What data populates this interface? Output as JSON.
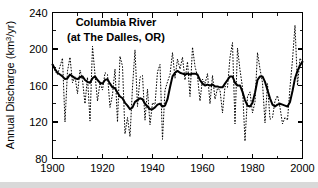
{
  "chart_data": {
    "type": "line",
    "title": "Columbia River",
    "subtitle": "(at The Dalles, OR)",
    "xlabel": "",
    "ylabel": "Annual Discharge (km3/yr)",
    "ylabel_main": "Annual Discharge (km",
    "ylabel_sup": "3",
    "ylabel_tail": "/yr)",
    "xlim": [
      1900,
      2000
    ],
    "ylim": [
      80,
      240
    ],
    "x_ticks": [
      1900,
      1920,
      1940,
      1960,
      1980,
      2000
    ],
    "y_ticks": [
      80,
      120,
      160,
      200,
      240
    ],
    "x_minor_interval": 10,
    "y_minor_interval": 20,
    "grid": false,
    "legend": "none",
    "units": "km3/yr",
    "line_color": "#000000",
    "series": [
      {
        "name": "Annual discharge",
        "style": "dotted",
        "x": [
          1900,
          1901,
          1902,
          1903,
          1904,
          1905,
          1906,
          1907,
          1908,
          1909,
          1910,
          1911,
          1912,
          1913,
          1914,
          1915,
          1916,
          1917,
          1918,
          1919,
          1920,
          1921,
          1922,
          1923,
          1924,
          1925,
          1926,
          1927,
          1928,
          1929,
          1930,
          1931,
          1932,
          1933,
          1934,
          1935,
          1936,
          1937,
          1938,
          1939,
          1940,
          1941,
          1942,
          1943,
          1944,
          1945,
          1946,
          1947,
          1948,
          1949,
          1950,
          1951,
          1952,
          1953,
          1954,
          1955,
          1956,
          1957,
          1958,
          1959,
          1960,
          1961,
          1962,
          1963,
          1964,
          1965,
          1966,
          1967,
          1968,
          1969,
          1970,
          1971,
          1972,
          1973,
          1974,
          1975,
          1976,
          1977,
          1978,
          1979,
          1980,
          1981,
          1982,
          1983,
          1984,
          1985,
          1986,
          1987,
          1988,
          1989,
          1990,
          1991,
          1992,
          1993,
          1994,
          1995,
          1996,
          1997,
          1998,
          1999,
          2000
        ],
        "values": [
          184,
          176,
          172,
          181,
          190,
          120,
          176,
          191,
          163,
          170,
          151,
          177,
          166,
          140,
          169,
          121,
          203,
          172,
          143,
          163,
          155,
          174,
          172,
          136,
          150,
          178,
          120,
          192,
          181,
          107,
          125,
          104,
          158,
          199,
          137,
          169,
          171,
          122,
          156,
          117,
          141,
          139,
          175,
          183,
          101,
          155,
          164,
          172,
          196,
          168,
          189,
          178,
          191,
          166,
          186,
          148,
          202,
          181,
          170,
          143,
          167,
          162,
          173,
          140,
          171,
          145,
          157,
          155,
          130,
          159,
          158,
          191,
          207,
          118,
          201,
          177,
          158,
          99,
          148,
          153,
          130,
          142,
          196,
          178,
          163,
          119,
          162,
          123,
          125,
          143,
          149,
          136,
          118,
          125,
          122,
          158,
          188,
          226,
          160,
          190,
          185
        ]
      },
      {
        "name": "Smoothed (filtered) discharge",
        "style": "solid",
        "x": [
          1900,
          1901,
          1902,
          1903,
          1904,
          1905,
          1906,
          1907,
          1908,
          1909,
          1910,
          1911,
          1912,
          1913,
          1914,
          1915,
          1916,
          1917,
          1918,
          1919,
          1920,
          1921,
          1922,
          1923,
          1924,
          1925,
          1926,
          1927,
          1928,
          1929,
          1930,
          1931,
          1932,
          1933,
          1934,
          1935,
          1936,
          1937,
          1938,
          1939,
          1940,
          1941,
          1942,
          1943,
          1944,
          1945,
          1946,
          1947,
          1948,
          1949,
          1950,
          1951,
          1952,
          1953,
          1954,
          1955,
          1956,
          1957,
          1958,
          1959,
          1960,
          1961,
          1962,
          1963,
          1964,
          1965,
          1966,
          1967,
          1968,
          1969,
          1970,
          1971,
          1972,
          1973,
          1974,
          1975,
          1976,
          1977,
          1978,
          1979,
          1980,
          1981,
          1982,
          1983,
          1984,
          1985,
          1986,
          1987,
          1988,
          1989,
          1990,
          1991,
          1992,
          1993,
          1994,
          1995,
          1996,
          1997,
          1998,
          1999,
          2000
        ],
        "values": [
          183,
          178,
          174,
          172,
          170,
          167,
          168,
          172,
          170,
          168,
          167,
          169,
          170,
          166,
          164,
          163,
          168,
          170,
          166,
          163,
          162,
          166,
          167,
          162,
          158,
          157,
          152,
          148,
          146,
          141,
          138,
          134,
          136,
          142,
          144,
          146,
          145,
          140,
          137,
          134,
          134,
          136,
          139,
          140,
          137,
          138,
          145,
          158,
          170,
          174,
          176,
          174,
          173,
          172,
          173,
          172,
          173,
          173,
          172,
          166,
          162,
          160,
          161,
          160,
          161,
          159,
          159,
          158,
          158,
          162,
          166,
          170,
          170,
          163,
          160,
          160,
          153,
          144,
          138,
          137,
          141,
          152,
          166,
          170,
          170,
          164,
          155,
          146,
          139,
          137,
          139,
          140,
          139,
          138,
          137,
          142,
          154,
          168,
          176,
          182,
          186
        ]
      }
    ]
  },
  "labels": {
    "title_line1": "Columbia River",
    "title_line2": "(at The Dalles, OR)",
    "y_axis_prefix": "Annual Discharge (km",
    "y_axis_sup": "3",
    "y_axis_suffix": "/yr)",
    "x_tick_0": "1900",
    "x_tick_1": "1920",
    "x_tick_2": "1940",
    "x_tick_3": "1960",
    "x_tick_4": "1980",
    "x_tick_5": "2000",
    "y_tick_0": "80",
    "y_tick_1": "120",
    "y_tick_2": "160",
    "y_tick_3": "200",
    "y_tick_4": "240"
  }
}
